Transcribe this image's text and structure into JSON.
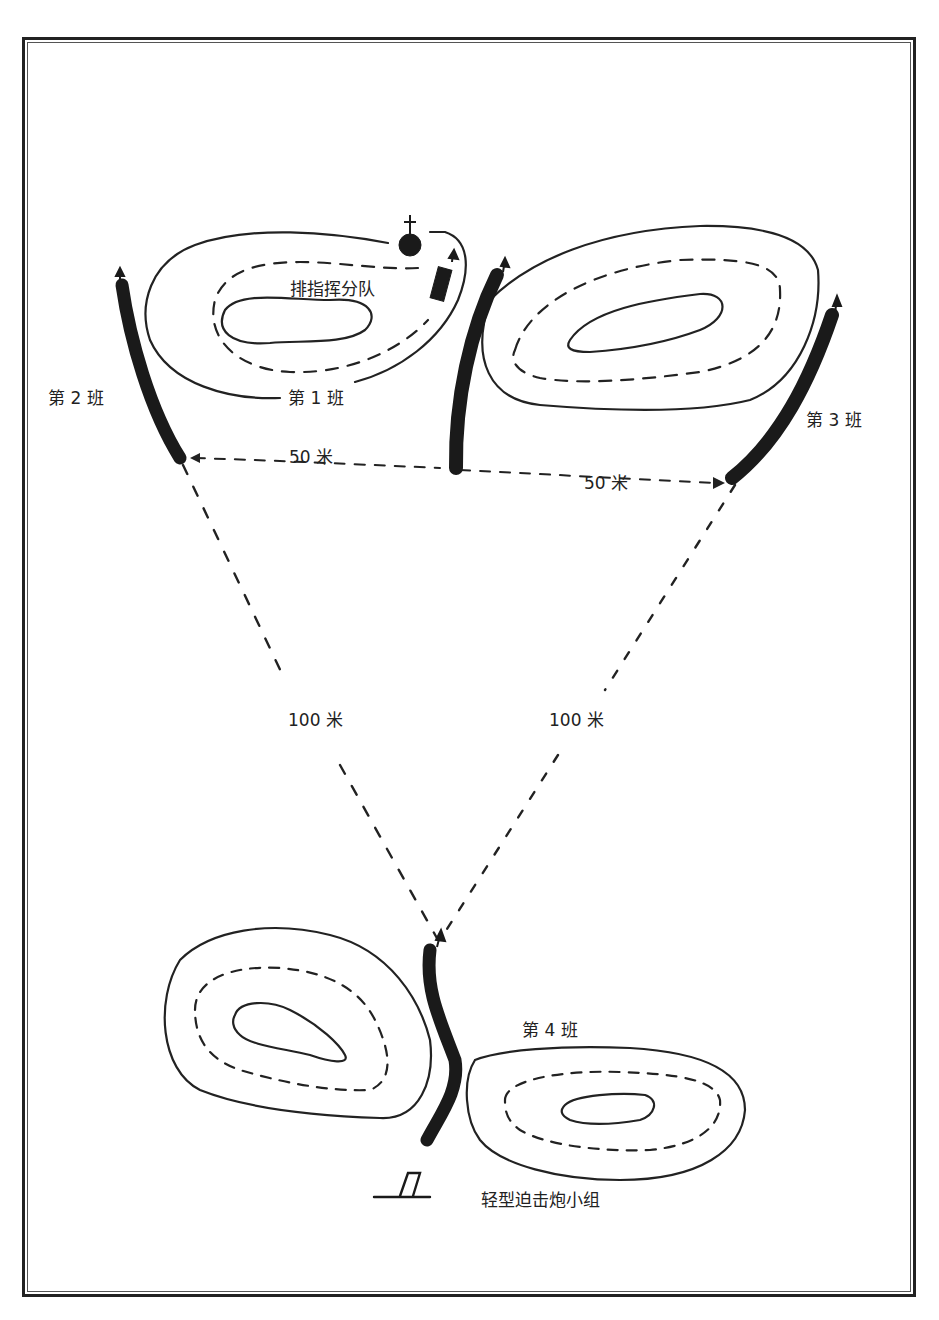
{
  "diagram": {
    "type": "platoon-defensive-deployment",
    "labels": {
      "hq": "排指挥分队",
      "squad1": "第 1 班",
      "squad2": "第 2 班",
      "squad3": "第 3 班",
      "squad4": "第 4 班",
      "mortar": "轻型迫击炮小组",
      "dist_left_50": "50 米",
      "dist_right_50": "50 米",
      "dist_left_100": "100 米",
      "dist_right_100": "100 米"
    },
    "colors": {
      "ink": "#222222",
      "background": "#ffffff"
    }
  }
}
